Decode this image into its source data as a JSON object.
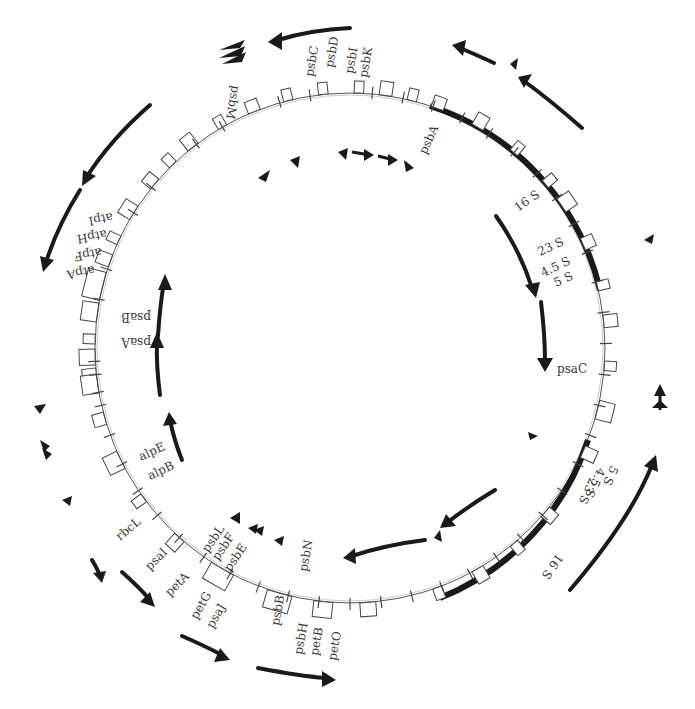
{
  "map": {
    "type": "circular-genome-map",
    "center": [
      350,
      348
    ],
    "radius": 255,
    "inverted_repeats": [
      {
        "name": "IR-a",
        "start_deg": 18,
        "end_deg": 95
      },
      {
        "name": "IR-b",
        "start_deg": 118,
        "end_deg": 186
      }
    ]
  },
  "labels": [
    {
      "id": "psbM",
      "text": "psbM",
      "x": 232,
      "y": 85,
      "rot": 100
    },
    {
      "id": "psbC",
      "text": "psbC",
      "x": 313,
      "y": 77,
      "rot": -80
    },
    {
      "id": "psbD",
      "text": "psbD",
      "x": 333,
      "y": 68,
      "rot": -80
    },
    {
      "id": "psbI",
      "text": "psbI",
      "x": 353,
      "y": 74,
      "rot": -80
    },
    {
      "id": "psbK",
      "text": "psbK",
      "x": 367,
      "y": 78,
      "rot": -80
    },
    {
      "id": "psbA",
      "text": "psbA",
      "x": 426,
      "y": 155,
      "rot": -65
    },
    {
      "id": "16S-a",
      "text": "16 S",
      "x": 518,
      "y": 212,
      "rot": -35
    },
    {
      "id": "23S-a",
      "text": "23 S",
      "x": 540,
      "y": 256,
      "rot": -25
    },
    {
      "id": "4.5S-a",
      "text": "4.5 S",
      "x": 543,
      "y": 277,
      "rot": -25
    },
    {
      "id": "5S-a",
      "text": "5 S",
      "x": 556,
      "y": 287,
      "rot": -25
    },
    {
      "id": "psaC",
      "text": "psaC",
      "x": 557,
      "y": 373,
      "rot": 0
    },
    {
      "id": "5S-b",
      "text": "5 S",
      "x": 611,
      "y": 465,
      "rot": 115
    },
    {
      "id": "4.5S-b",
      "text": "4.5 S",
      "x": 598,
      "y": 467,
      "rot": 115
    },
    {
      "id": "23S-b",
      "text": "23 S",
      "x": 590,
      "y": 477,
      "rot": 115
    },
    {
      "id": "16S-b",
      "text": "16 S",
      "x": 557,
      "y": 553,
      "rot": 125
    },
    {
      "id": "psbN",
      "text": "psbN",
      "x": 307,
      "y": 572,
      "rot": -80
    },
    {
      "id": "psbB",
      "text": "psbB",
      "x": 279,
      "y": 626,
      "rot": -80
    },
    {
      "id": "psbH",
      "text": "psbH",
      "x": 302,
      "y": 655,
      "rot": -80
    },
    {
      "id": "petB",
      "text": "petB",
      "x": 318,
      "y": 656,
      "rot": -80
    },
    {
      "id": "petO",
      "text": "petO",
      "x": 336,
      "y": 661,
      "rot": -80
    },
    {
      "id": "psbL",
      "text": "psbL",
      "x": 208,
      "y": 553,
      "rot": -55
    },
    {
      "id": "psbF",
      "text": "psbF",
      "x": 218,
      "y": 561,
      "rot": -55
    },
    {
      "id": "psbE",
      "text": "psbE",
      "x": 230,
      "y": 572,
      "rot": -55
    },
    {
      "id": "petG",
      "text": "petG",
      "x": 197,
      "y": 620,
      "rot": -60
    },
    {
      "id": "psaJ",
      "text": "psaJ",
      "x": 213,
      "y": 629,
      "rot": -60
    },
    {
      "id": "petA",
      "text": "petA",
      "x": 170,
      "y": 597,
      "rot": -45
    },
    {
      "id": "psaI",
      "text": "psaI",
      "x": 150,
      "y": 571,
      "rot": -45
    },
    {
      "id": "rbcL",
      "text": "rbcL",
      "x": 120,
      "y": 541,
      "rot": -40
    },
    {
      "id": "alpB",
      "text": "alpB",
      "x": 150,
      "y": 480,
      "rot": -25
    },
    {
      "id": "alpE",
      "text": "alpE",
      "x": 141,
      "y": 461,
      "rot": -25
    },
    {
      "id": "psaA",
      "text": "psaA",
      "x": 151,
      "y": 338,
      "rot": 180
    },
    {
      "id": "psaB",
      "text": "psaB",
      "x": 151,
      "y": 313,
      "rot": 180
    },
    {
      "id": "atpA",
      "text": "atpA",
      "x": 94,
      "y": 266,
      "rot": 170
    },
    {
      "id": "atpF",
      "text": "atpF",
      "x": 101,
      "y": 248,
      "rot": 170
    },
    {
      "id": "atpH",
      "text": "atpH",
      "x": 106,
      "y": 230,
      "rot": 170
    },
    {
      "id": "atpI",
      "text": "atpI",
      "x": 112,
      "y": 213,
      "rot": 170
    }
  ],
  "transcripts": [
    {
      "id": "t1",
      "direction": "ccw",
      "desc": "top arc arrow over psbC-psbK"
    },
    {
      "id": "t2",
      "direction": "ccw",
      "desc": "top-right arrows over psbA region"
    },
    {
      "id": "t3",
      "direction": "ccw",
      "desc": "left-upper arc over atp genes"
    },
    {
      "id": "t4",
      "direction": "cw",
      "desc": "right inner arc 16S-psaC"
    },
    {
      "id": "t5",
      "direction": "cw",
      "desc": "right outer arc 16S-5S (IR-b)"
    },
    {
      "id": "t6",
      "direction": "ccw",
      "desc": "inner bottom arc"
    },
    {
      "id": "t7",
      "direction": "cw",
      "desc": "inner left arc psaA/psaB"
    },
    {
      "id": "t8",
      "direction": "cw",
      "desc": "bottom arc psbB-petO"
    }
  ]
}
